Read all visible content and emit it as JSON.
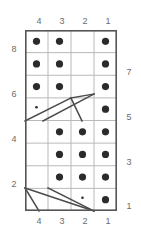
{
  "diagram": {
    "type": "dot-grid-draft",
    "columns": 4,
    "rows": 8,
    "colors": {
      "dot": "#2b2b2b",
      "inner_grid_line": "#b9b9b9",
      "outer_border": "#555555",
      "label_text": "#6b6b6b",
      "diagonal_line": "#4a4a4a",
      "background": "#ffffff"
    },
    "labels": {
      "top": [
        "4",
        "3",
        "2",
        "1"
      ],
      "bottom": [
        "4",
        "3",
        "2",
        "1"
      ],
      "left": [
        "8",
        "6",
        "4",
        "2"
      ],
      "right": [
        "7",
        "5",
        "3",
        "1"
      ],
      "left_rows": [
        1,
        3,
        5,
        7
      ],
      "right_rows": [
        2,
        4,
        6,
        8
      ]
    },
    "cells": [
      {
        "row": 1,
        "col": 1,
        "mark": "dot"
      },
      {
        "row": 1,
        "col": 2,
        "mark": "dot"
      },
      {
        "row": 1,
        "col": 3,
        "mark": "empty"
      },
      {
        "row": 1,
        "col": 4,
        "mark": "dot"
      },
      {
        "row": 2,
        "col": 1,
        "mark": "dot"
      },
      {
        "row": 2,
        "col": 2,
        "mark": "dot"
      },
      {
        "row": 2,
        "col": 3,
        "mark": "empty"
      },
      {
        "row": 2,
        "col": 4,
        "mark": "dot"
      },
      {
        "row": 3,
        "col": 1,
        "mark": "dot"
      },
      {
        "row": 3,
        "col": 2,
        "mark": "dot"
      },
      {
        "row": 3,
        "col": 3,
        "mark": "empty"
      },
      {
        "row": 3,
        "col": 4,
        "mark": "dot"
      },
      {
        "row": 4,
        "col": 1,
        "mark": "small-dot"
      },
      {
        "row": 4,
        "col": 2,
        "mark": "empty"
      },
      {
        "row": 4,
        "col": 3,
        "mark": "empty"
      },
      {
        "row": 4,
        "col": 4,
        "mark": "dot"
      },
      {
        "row": 5,
        "col": 1,
        "mark": "empty"
      },
      {
        "row": 5,
        "col": 2,
        "mark": "dot"
      },
      {
        "row": 5,
        "col": 3,
        "mark": "dot"
      },
      {
        "row": 5,
        "col": 4,
        "mark": "dot"
      },
      {
        "row": 6,
        "col": 1,
        "mark": "empty"
      },
      {
        "row": 6,
        "col": 2,
        "mark": "dot"
      },
      {
        "row": 6,
        "col": 3,
        "mark": "dot"
      },
      {
        "row": 6,
        "col": 4,
        "mark": "dot"
      },
      {
        "row": 7,
        "col": 1,
        "mark": "empty"
      },
      {
        "row": 7,
        "col": 2,
        "mark": "dot"
      },
      {
        "row": 7,
        "col": 3,
        "mark": "dot"
      },
      {
        "row": 7,
        "col": 4,
        "mark": "dot"
      },
      {
        "row": 8,
        "col": 1,
        "mark": "empty"
      },
      {
        "row": 8,
        "col": 2,
        "mark": "empty"
      },
      {
        "row": 8,
        "col": 3,
        "mark": "small-dot"
      },
      {
        "row": 8,
        "col": 4,
        "mark": "dot"
      }
    ],
    "diagonals": [
      {
        "id": "upper-long-a",
        "row_band": 4,
        "x1": 0,
        "y1": 91,
        "x2": 46,
        "y2": 68
      },
      {
        "id": "upper-long-b",
        "row_band": 4,
        "x1": 18,
        "y1": 91,
        "x2": 69,
        "y2": 64
      },
      {
        "id": "upper-apex",
        "row_band": 4,
        "x1": 46,
        "y1": 68,
        "x2": 69,
        "y2": 64
      },
      {
        "id": "upper-tick",
        "row_band": 4,
        "x1": 46,
        "y1": 68,
        "x2": 57,
        "y2": 91
      },
      {
        "id": "lower-long-a",
        "row_band": 8,
        "x1": 0,
        "y1": 158,
        "x2": 69,
        "y2": 181
      },
      {
        "id": "lower-long-b",
        "row_band": 8,
        "x1": 23,
        "y1": 158,
        "x2": 69,
        "y2": 181
      },
      {
        "id": "lower-tick",
        "row_band": 8,
        "x1": 0,
        "y1": 158,
        "x2": 14,
        "y2": 181
      }
    ]
  }
}
